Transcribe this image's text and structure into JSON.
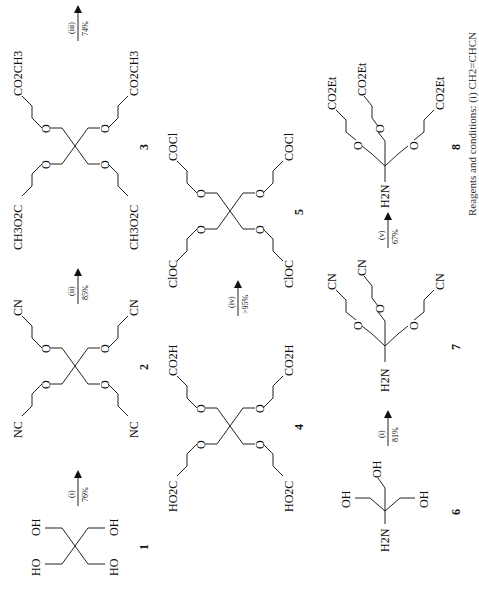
{
  "scheme": {
    "compounds": [
      {
        "id": "1",
        "label": "1",
        "groups": [
          "HO",
          "OH",
          "HO",
          "OH"
        ]
      },
      {
        "id": "2",
        "label": "2",
        "groups": [
          "NC",
          "CN",
          "NC",
          "CN"
        ]
      },
      {
        "id": "3",
        "label": "3",
        "groups": [
          "CH3O2C",
          "CO2CH3",
          "CH3O2C",
          "CO2CH3"
        ]
      },
      {
        "id": "4",
        "label": "4",
        "groups": [
          "HO2C",
          "CO2H",
          "HO2C",
          "CO2H"
        ]
      },
      {
        "id": "5",
        "label": "5",
        "groups": [
          "ClOC",
          "COCl",
          "ClOC",
          "COCl"
        ]
      },
      {
        "id": "6",
        "label": "6",
        "groups": [
          "H2N",
          "OH",
          "OH",
          "OH"
        ]
      },
      {
        "id": "7",
        "label": "7",
        "groups": [
          "H2N",
          "CN",
          "CN",
          "CN"
        ]
      },
      {
        "id": "8",
        "label": "8",
        "groups": [
          "H2N",
          "CO2Et",
          "CO2Et",
          "CO2Et"
        ]
      }
    ],
    "arrows": [
      {
        "from": "1",
        "to": "2",
        "reagent": "(i)",
        "yield": "76%"
      },
      {
        "from": "2",
        "to": "3",
        "reagent": "(ii)",
        "yield": "85%"
      },
      {
        "from": "3",
        "to": "4",
        "reagent": "(iii)",
        "yield": "74%"
      },
      {
        "from": "4",
        "to": "5",
        "reagent": "(iv)",
        "yield": ">95%"
      },
      {
        "from": "6",
        "to": "7",
        "reagent": "(i)",
        "yield": "81%"
      },
      {
        "from": "7",
        "to": "8",
        "reagent": "(v)",
        "yield": "67%"
      }
    ],
    "caption": "Reagents and conditions: (i) CH2=CHCN"
  }
}
